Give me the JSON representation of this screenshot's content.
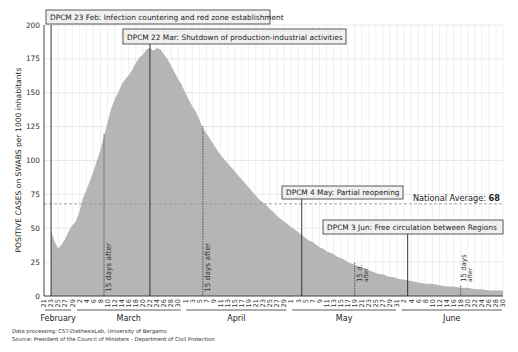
{
  "chart_data": {
    "type": "area",
    "title": "",
    "ylabel": "POSITIVE CASES on SWABS per 1000 inhabitants",
    "xlabel": "",
    "ylim": [
      0,
      200
    ],
    "yticks": [
      0,
      25,
      50,
      75,
      100,
      125,
      150,
      175,
      200
    ],
    "grid": true,
    "fill_color": "#b5b5b5",
    "x_start": "2020-02-21",
    "x_end": "2020-06-30",
    "months": [
      {
        "label": "February",
        "start_day": 0,
        "end_day": 8
      },
      {
        "label": "March",
        "start_day": 9,
        "end_day": 39
      },
      {
        "label": "April",
        "start_day": 40,
        "end_day": 69
      },
      {
        "label": "May",
        "start_day": 70,
        "end_day": 100
      },
      {
        "label": "June",
        "start_day": 101,
        "end_day": 130
      }
    ],
    "x_tick_labels": {
      "February": [
        "21",
        "23",
        "25",
        "27",
        "29"
      ],
      "March": [
        "2",
        "4",
        "6",
        "8",
        "10",
        "12",
        "14",
        "16",
        "18",
        "20",
        "22",
        "24",
        "26",
        "28",
        "30"
      ],
      "April": [
        "1",
        "3",
        "5",
        "7",
        "9",
        "11",
        "13",
        "15",
        "17",
        "19",
        "21",
        "23",
        "25",
        "27",
        "29"
      ],
      "May": [
        "1",
        "3",
        "5",
        "7",
        "9",
        "11",
        "13",
        "15",
        "17",
        "19",
        "21",
        "23",
        "25",
        "27",
        "29",
        "31"
      ],
      "June": [
        "2",
        "4",
        "6",
        "8",
        "10",
        "12",
        "14",
        "16",
        "18",
        "20",
        "22",
        "24",
        "26",
        "28",
        "30"
      ]
    },
    "series": [
      {
        "name": "Positive cases on swabs per 1000 inhabitants",
        "points": [
          [
            2,
            48
          ],
          [
            3,
            40
          ],
          [
            4,
            35
          ],
          [
            5,
            38
          ],
          [
            6,
            42
          ],
          [
            7,
            48
          ],
          [
            8,
            52
          ],
          [
            9,
            55
          ],
          [
            10,
            62
          ],
          [
            11,
            72
          ],
          [
            12,
            78
          ],
          [
            13,
            85
          ],
          [
            14,
            92
          ],
          [
            15,
            100
          ],
          [
            16,
            108
          ],
          [
            17,
            118
          ],
          [
            18,
            128
          ],
          [
            19,
            138
          ],
          [
            20,
            145
          ],
          [
            21,
            150
          ],
          [
            22,
            156
          ],
          [
            23,
            160
          ],
          [
            24,
            163
          ],
          [
            25,
            167
          ],
          [
            26,
            172
          ],
          [
            27,
            176
          ],
          [
            28,
            178
          ],
          [
            29,
            182
          ],
          [
            30,
            183
          ],
          [
            31,
            181
          ],
          [
            32,
            183
          ],
          [
            33,
            182
          ],
          [
            34,
            178
          ],
          [
            35,
            175
          ],
          [
            36,
            170
          ],
          [
            37,
            165
          ],
          [
            38,
            160
          ],
          [
            39,
            156
          ],
          [
            40,
            150
          ],
          [
            41,
            145
          ],
          [
            42,
            140
          ],
          [
            43,
            136
          ],
          [
            44,
            130
          ],
          [
            45,
            124
          ],
          [
            46,
            120
          ],
          [
            47,
            116
          ],
          [
            48,
            112
          ],
          [
            49,
            108
          ],
          [
            50,
            104
          ],
          [
            51,
            101
          ],
          [
            52,
            98
          ],
          [
            53,
            95
          ],
          [
            54,
            92
          ],
          [
            55,
            89
          ],
          [
            56,
            86
          ],
          [
            57,
            83
          ],
          [
            58,
            80
          ],
          [
            59,
            77
          ],
          [
            60,
            74
          ],
          [
            61,
            71
          ],
          [
            62,
            69
          ],
          [
            63,
            67
          ],
          [
            64,
            64
          ],
          [
            65,
            62
          ],
          [
            66,
            59
          ],
          [
            67,
            57
          ],
          [
            68,
            55
          ],
          [
            69,
            53
          ],
          [
            70,
            51
          ],
          [
            71,
            49
          ],
          [
            72,
            47
          ],
          [
            73,
            45
          ],
          [
            74,
            43
          ],
          [
            75,
            41
          ],
          [
            76,
            40
          ],
          [
            77,
            38
          ],
          [
            78,
            36
          ],
          [
            79,
            35
          ],
          [
            80,
            33
          ],
          [
            81,
            32
          ],
          [
            82,
            31
          ],
          [
            83,
            29
          ],
          [
            84,
            28
          ],
          [
            85,
            27
          ],
          [
            86,
            25
          ],
          [
            87,
            24
          ],
          [
            88,
            23
          ],
          [
            89,
            22
          ],
          [
            90,
            21
          ],
          [
            91,
            20
          ],
          [
            92,
            19
          ],
          [
            93,
            18
          ],
          [
            94,
            17
          ],
          [
            95,
            16
          ],
          [
            96,
            16
          ],
          [
            97,
            15
          ],
          [
            98,
            14
          ],
          [
            99,
            14
          ],
          [
            100,
            13
          ],
          [
            102,
            12
          ],
          [
            104,
            11
          ],
          [
            106,
            10
          ],
          [
            108,
            9
          ],
          [
            110,
            9
          ],
          [
            112,
            8
          ],
          [
            114,
            7
          ],
          [
            116,
            7
          ],
          [
            118,
            6
          ],
          [
            120,
            6
          ],
          [
            122,
            5
          ],
          [
            124,
            5
          ],
          [
            126,
            4
          ],
          [
            128,
            4
          ],
          [
            130,
            4
          ]
        ]
      }
    ],
    "reference_line": {
      "label": "National Average:",
      "value": 68,
      "value_label": "68",
      "style": "dashed"
    },
    "annotations": [
      {
        "text": "DPCM 23 Feb: Infection countering and red zone establishment",
        "day": 2,
        "style": "solid"
      },
      {
        "text": "DPCM 22 Mar: Shutdown of production-industrial activities",
        "day": 30,
        "style": "solid"
      },
      {
        "text": "DPCM 4 May: Partial reopening",
        "day": 73,
        "style": "solid"
      },
      {
        "text": "DPCM 3 Jun: Free circulation between Regions",
        "day": 103,
        "style": "solid"
      },
      {
        "text": "15 days after",
        "day": 17,
        "style": "dashed"
      },
      {
        "text": "15 days after",
        "day": 45,
        "style": "dashed"
      },
      {
        "text": "15 d. after",
        "day": 88,
        "style": "dashed"
      },
      {
        "text": "15 days after",
        "day": 118,
        "style": "dashed"
      }
    ]
  },
  "footer": {
    "line1": "Data processing: CST-DiathesisLab, University of Bergamo",
    "line2": "Source: President of the Council of Ministers - Department of Civil Protection"
  }
}
